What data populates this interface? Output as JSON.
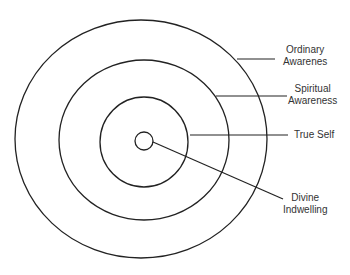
{
  "diagram": {
    "type": "concentric-circles",
    "stroke_color": "#222222",
    "labels": [
      {
        "id": "ordinary",
        "line1": "Ordinary",
        "line2": "Awarenes"
      },
      {
        "id": "spiritual",
        "line1": "Spiritual",
        "line2": "Awareness"
      },
      {
        "id": "true-self",
        "line1": "True Self",
        "line2": ""
      },
      {
        "id": "divine",
        "line1": "Divine",
        "line2": "Indwelling"
      }
    ]
  }
}
